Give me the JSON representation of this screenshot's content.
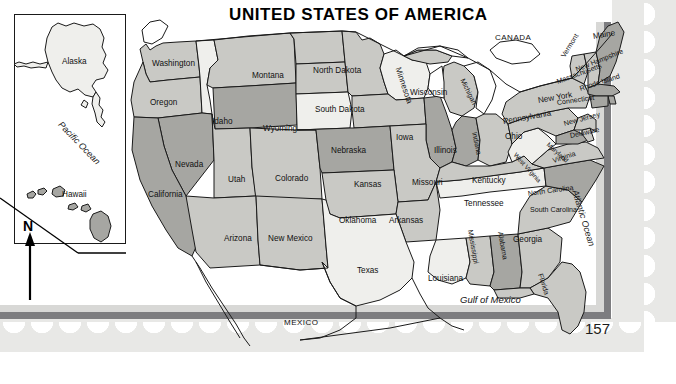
{
  "page": {
    "title": "UNITED STATES OF AMERICA",
    "page_number": "157"
  },
  "insets": {
    "alaska": {
      "label": "Alaska"
    },
    "hawaii": {
      "label": "Hawaii"
    },
    "pacific_ocean": {
      "label": "Pacific Ocean"
    },
    "compass": {
      "label": "N",
      "name": "north-arrow"
    }
  },
  "countries": [
    {
      "label": "CANADA"
    },
    {
      "label": "MEXICO"
    }
  ],
  "waters": [
    {
      "label": "Pacific Ocean"
    },
    {
      "label": "Atlantic Ocean"
    },
    {
      "label": "Gulf of Mexico"
    }
  ],
  "colors": {
    "shade_light": "#efefec",
    "shade_mid": "#c9c9c5",
    "shade_dark": "#a6a6a2",
    "stroke": "#1a1a1a",
    "stamp_bg": "#e8e8e6",
    "frame_band": "#7d7d80",
    "page_white": "#ffffff"
  },
  "states": [
    {
      "label": "Washington",
      "shade": "mid"
    },
    {
      "label": "Oregon",
      "shade": "mid"
    },
    {
      "label": "Idaho",
      "shade": "light"
    },
    {
      "label": "Montana",
      "shade": "mid"
    },
    {
      "label": "Wyoming",
      "shade": "dark"
    },
    {
      "label": "North Dakota",
      "shade": "mid"
    },
    {
      "label": "South Dakota",
      "shade": "mid"
    },
    {
      "label": "Nebraska",
      "shade": "light"
    },
    {
      "label": "Minnesota",
      "shade": "mid"
    },
    {
      "label": "Wisconsin",
      "shade": "light"
    },
    {
      "label": "Iowa",
      "shade": "mid"
    },
    {
      "label": "Illinois",
      "shade": "dark"
    },
    {
      "label": "Michigan",
      "shade": "mid"
    },
    {
      "label": "Indiana",
      "shade": "dark"
    },
    {
      "label": "Ohio",
      "shade": "mid"
    },
    {
      "label": "Nevada",
      "shade": "dark"
    },
    {
      "label": "Utah",
      "shade": "mid"
    },
    {
      "label": "Colorado",
      "shade": "mid"
    },
    {
      "label": "Kansas",
      "shade": "dark"
    },
    {
      "label": "Missouri",
      "shade": "mid"
    },
    {
      "label": "California",
      "shade": "dark"
    },
    {
      "label": "Arizona",
      "shade": "mid"
    },
    {
      "label": "New Mexico",
      "shade": "mid"
    },
    {
      "label": "Oklahoma",
      "shade": "mid"
    },
    {
      "label": "Arkansas",
      "shade": "mid"
    },
    {
      "label": "Texas",
      "shade": "light"
    },
    {
      "label": "Louisiana",
      "shade": "light"
    },
    {
      "label": "Mississippi",
      "shade": "mid"
    },
    {
      "label": "Alabama",
      "shade": "dark"
    },
    {
      "label": "Tennessee",
      "shade": "light"
    },
    {
      "label": "Kentucky",
      "shade": "mid"
    },
    {
      "label": "Georgia",
      "shade": "mid"
    },
    {
      "label": "Florida",
      "shade": "mid"
    },
    {
      "label": "South Carolina",
      "shade": "mid"
    },
    {
      "label": "North Carolina",
      "shade": "dark"
    },
    {
      "label": "Virginia",
      "shade": "mid"
    },
    {
      "label": "West Virginia",
      "shade": "light"
    },
    {
      "label": "Maryland",
      "shade": "dark"
    },
    {
      "label": "Delaware",
      "shade": "mid"
    },
    {
      "label": "New Jersey",
      "shade": "mid"
    },
    {
      "label": "Pennsylvania",
      "shade": "mid"
    },
    {
      "label": "New York",
      "shade": "mid"
    },
    {
      "label": "Connecticut",
      "shade": "dark"
    },
    {
      "label": "Rhode Island",
      "shade": "dark"
    },
    {
      "label": "Massachusetts",
      "shade": "dark"
    },
    {
      "label": "Vermont",
      "shade": "mid"
    },
    {
      "label": "New Hampshire",
      "shade": "mid"
    },
    {
      "label": "Maine",
      "shade": "dark"
    }
  ]
}
